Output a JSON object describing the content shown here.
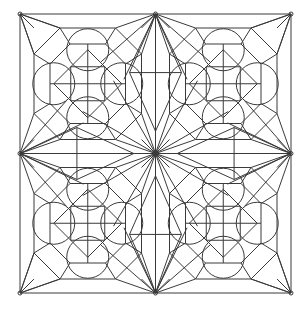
{
  "artwork": {
    "title": "Symmetric Geometric Mandala Pattern",
    "kind": "line-art",
    "medium": "coloring-page outline drawing",
    "description": "Square frame enclosing a two-by-two grid of identical ornamental tiles; each tile holds an octagonal frame, a central four-pane square, an inscribed diamond and four circles; straight lines radiate from the canvas centre and from each edge midpoint."
  },
  "canvas": {
    "width": 307,
    "height": 309,
    "background_color": "#ffffff"
  },
  "style": {
    "stroke_color": "#3a3a3a",
    "stroke_color_light": "#4a4a4a",
    "stroke_width": 1,
    "fill": "none"
  },
  "frame": {
    "label": "outer-border",
    "left": 20,
    "top": 14,
    "right": 291,
    "bottom": 293,
    "width": 271,
    "height": 279
  },
  "grid": {
    "columns": 2,
    "rows": 2,
    "tile_width": 135.5,
    "tile_height": 139.5,
    "center_x": 155.5,
    "center_y": 153.5,
    "tiles": [
      {
        "name": "tile-top-left",
        "col": 0,
        "row": 0,
        "origin_x": 20,
        "origin_y": 14
      },
      {
        "name": "tile-top-right",
        "col": 1,
        "row": 0,
        "origin_x": 155.5,
        "origin_y": 14
      },
      {
        "name": "tile-bottom-left",
        "col": 0,
        "row": 1,
        "origin_x": 20,
        "origin_y": 153.5
      },
      {
        "name": "tile-bottom-right",
        "col": 1,
        "row": 1,
        "origin_x": 155.5,
        "origin_y": 153.5
      }
    ]
  },
  "tile_motif": {
    "name": "ornamental-tile",
    "octagon_frame": {
      "label": "inner-octagon-frame",
      "inset": 14,
      "corner_cut": 26
    },
    "inner_band": {
      "label": "inner-band-rect",
      "inset": 30,
      "corner_cut": 20
    },
    "center_square": {
      "label": "center-four-pane-square",
      "size": 34,
      "panes": 4,
      "divider_count": 2
    },
    "diamond": {
      "label": "inscribed-diamond",
      "radius": 34,
      "points": 4
    },
    "circles": {
      "label": "diamond-point-circles",
      "count": 4,
      "radius": 21,
      "offset_from_center": 34,
      "positions": [
        "top",
        "right",
        "bottom",
        "left"
      ]
    },
    "corner_rays": {
      "label": "corner-diagonal-rays",
      "count_per_corner": 3
    }
  },
  "center_star": {
    "label": "central-radiating-star",
    "x": 155.5,
    "y": 153.5,
    "ray_count": 12,
    "hub_radius": 2.5
  },
  "edge_lenses": {
    "label": "edge-midpoint-lens",
    "count": 4,
    "positions": [
      "top",
      "right",
      "bottom",
      "left"
    ],
    "shape": "elongated diamond"
  },
  "palette": {
    "line": "#3a3a3a",
    "paper": "#ffffff"
  }
}
